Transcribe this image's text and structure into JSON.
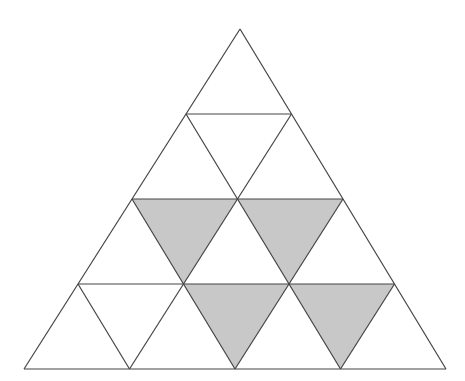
{
  "diagram": {
    "rows": 4,
    "apex": [
      240,
      29
    ],
    "base_left": [
      24,
      369
    ],
    "base_right": [
      446,
      369
    ],
    "colors": {
      "stroke": "#444444",
      "shade": "#c8c8c8",
      "background": "#ffffff"
    },
    "shaded": [
      {
        "row": 3,
        "index": 1
      },
      {
        "row": 3,
        "index": 2
      },
      {
        "row": 4,
        "index": 2
      },
      {
        "row": 4,
        "index": 3
      }
    ]
  }
}
